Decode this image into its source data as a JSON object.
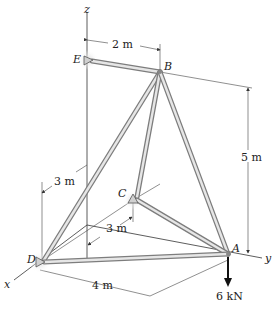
{
  "figure": {
    "type": "space truss",
    "nodes": [
      {
        "id": "A",
        "label": "A"
      },
      {
        "id": "B",
        "label": "B"
      },
      {
        "id": "C",
        "label": "C"
      },
      {
        "id": "D",
        "label": "D"
      },
      {
        "id": "E",
        "label": "E"
      }
    ],
    "members": [
      "EB",
      "BD",
      "BC",
      "BA",
      "CA",
      "DA"
    ],
    "supports": [
      "C",
      "D",
      "E"
    ],
    "axes": {
      "x": "x",
      "y": "y",
      "z": "z"
    },
    "dimensions": {
      "e_to_b": "2 m",
      "height_b": "5 m",
      "d_offset": "3 m",
      "c_offset": "3 m",
      "d_to_a": "4 m"
    },
    "load": {
      "label": "6 kN",
      "at": "A",
      "direction": "down"
    }
  }
}
